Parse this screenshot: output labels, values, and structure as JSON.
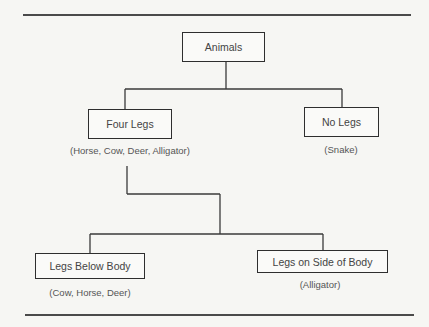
{
  "diagram": {
    "type": "tree",
    "root": {
      "label": "Animals",
      "children": [
        {
          "label": "Four Legs",
          "examples": "(Horse, Cow, Deer, Alligator)",
          "children": [
            {
              "label": "Legs Below Body",
              "examples": "(Cow, Horse, Deer)"
            },
            {
              "label": "Legs on Side of Body",
              "examples": "(Alligator)"
            }
          ]
        },
        {
          "label": "No Legs",
          "examples": "(Snake)"
        }
      ]
    }
  },
  "nodes": {
    "animals": "Animals",
    "four_legs": "Four Legs",
    "four_legs_examples": "(Horse, Cow, Deer, Alligator)",
    "no_legs": "No Legs",
    "no_legs_examples": "(Snake)",
    "legs_below": "Legs Below Body",
    "legs_below_examples": "(Cow, Horse, Deer)",
    "legs_side": "Legs on Side of Body",
    "legs_side_examples": "(Alligator)"
  }
}
